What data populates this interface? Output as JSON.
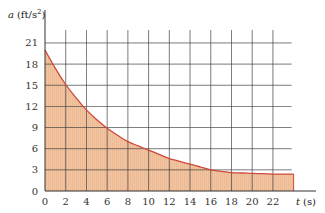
{
  "chart_data": {
    "type": "area",
    "title": "",
    "xlabel": "t (s)",
    "ylabel": "a (ft/s²)",
    "xlabel_var": "t",
    "xlabel_unit": "(s)",
    "ylabel_var": "a",
    "ylabel_unit": "(ft/s²)",
    "x_ticks": [
      0,
      2,
      4,
      6,
      8,
      10,
      12,
      14,
      16,
      18,
      20,
      22
    ],
    "y_ticks": [
      0,
      3,
      6,
      9,
      12,
      15,
      18,
      21
    ],
    "xlim": [
      0,
      24
    ],
    "ylim": [
      0,
      21
    ],
    "grid": true,
    "legend": null,
    "series": [
      {
        "name": "a(t)",
        "x": [
          0,
          1,
          2,
          3,
          4,
          5,
          6,
          7,
          8,
          9,
          10,
          11,
          12,
          13,
          14,
          15,
          16,
          17,
          18,
          19,
          20,
          21,
          22,
          23,
          24
        ],
        "values": [
          20,
          17.4,
          15.1,
          13.2,
          11.5,
          10.1,
          8.9,
          7.9,
          7.0,
          6.4,
          5.8,
          5.2,
          4.6,
          4.2,
          3.8,
          3.4,
          3.0,
          2.8,
          2.6,
          2.55,
          2.5,
          2.45,
          2.4,
          2.4,
          2.4
        ]
      }
    ],
    "fill_under_curve": true
  },
  "colors": {
    "fill": "#F2C4A0",
    "curve": "#D0473A",
    "grid": "#3C3C3C",
    "axis": "#333333"
  }
}
